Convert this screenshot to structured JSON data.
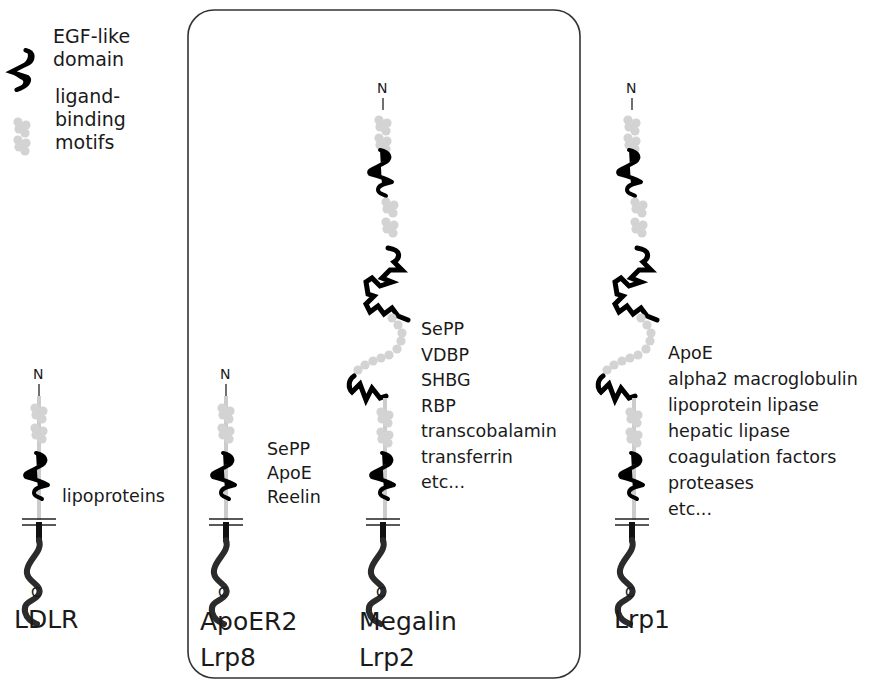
{
  "legend": {
    "egf": {
      "icon": "egf-like-domain-icon",
      "lines": [
        "EGF-like",
        "domain"
      ]
    },
    "ligand": {
      "icon": "ligand-binding-motifs-icon",
      "lines": [
        "ligand-",
        "binding",
        "motifs"
      ]
    }
  },
  "colors": {
    "egf": "#000000",
    "motif": "#d3d3d3",
    "cytoplasmic": "#333333",
    "box": "#333333"
  },
  "termini": {
    "n": "N",
    "c": "C"
  },
  "receptors": [
    {
      "id": "ldlr",
      "names": [
        "LDLR"
      ],
      "ligands": [
        "lipoproteins"
      ],
      "in_box": false
    },
    {
      "id": "apoer2",
      "names": [
        "ApoER2",
        "Lrp8"
      ],
      "ligands": [
        "SePP",
        "ApoE",
        "Reelin"
      ],
      "in_box": true
    },
    {
      "id": "megalin",
      "names": [
        "Megalin",
        "Lrp2"
      ],
      "ligands": [
        "SePP",
        "VDBP",
        "SHBG",
        "RBP",
        "transcobalamin",
        "transferrin",
        "etc..."
      ],
      "in_box": true
    },
    {
      "id": "lrp1",
      "names": [
        "Lrp1"
      ],
      "ligands": [
        "ApoE",
        "alpha2 macroglobulin",
        "lipoprotein lipase",
        "hepatic lipase",
        "coagulation factors",
        "proteases",
        "etc..."
      ],
      "in_box": false
    }
  ]
}
